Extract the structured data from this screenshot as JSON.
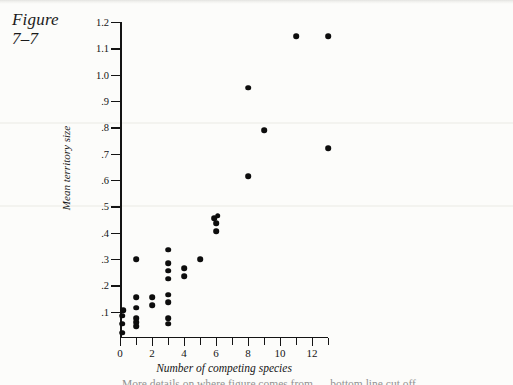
{
  "figure": {
    "label_line1": "Figure",
    "label_line2": "7–7"
  },
  "caption_partial": "More details on where figure comes from — bottom line cut off",
  "chart_data": {
    "type": "scatter",
    "title": "",
    "xlabel": "Number of competing species",
    "ylabel": "Mean territory size",
    "xlim": [
      0,
      13
    ],
    "ylim": [
      0,
      1.2
    ],
    "grid": false,
    "legend": null,
    "x_tick_labels": [
      "0",
      "2",
      "4",
      "6",
      "8",
      "10",
      "12"
    ],
    "x_tick_values": [
      0,
      2,
      4,
      6,
      8,
      10,
      12
    ],
    "x_minor_ticks": [
      1,
      3,
      5,
      7,
      9,
      11,
      13
    ],
    "y_tick_labels": [
      "1.2",
      "1.1",
      "1.0",
      ".9",
      ".8",
      ".7",
      ".6",
      ".5",
      ".4",
      ".3",
      ".2",
      ".1"
    ],
    "y_tick_values": [
      1.2,
      1.1,
      1.0,
      0.9,
      0.8,
      0.7,
      0.6,
      0.5,
      0.4,
      0.3,
      0.2,
      0.1
    ],
    "marker": "filled-circle",
    "marker_color": "#0d0d0d",
    "points": [
      {
        "x": 0.15,
        "y": 0.02
      },
      {
        "x": 0.15,
        "y": 0.055
      },
      {
        "x": 0.15,
        "y": 0.085
      },
      {
        "x": 0.2,
        "y": 0.105
      },
      {
        "x": 1.0,
        "y": 0.045
      },
      {
        "x": 1.0,
        "y": 0.06
      },
      {
        "x": 1.0,
        "y": 0.075
      },
      {
        "x": 1.0,
        "y": 0.115
      },
      {
        "x": 1.0,
        "y": 0.155
      },
      {
        "x": 1.0,
        "y": 0.3
      },
      {
        "x": 2.0,
        "y": 0.125
      },
      {
        "x": 2.0,
        "y": 0.155
      },
      {
        "x": 3.0,
        "y": 0.055
      },
      {
        "x": 3.0,
        "y": 0.075
      },
      {
        "x": 3.0,
        "y": 0.135
      },
      {
        "x": 3.0,
        "y": 0.165
      },
      {
        "x": 3.0,
        "y": 0.225
      },
      {
        "x": 3.0,
        "y": 0.255
      },
      {
        "x": 3.0,
        "y": 0.285
      },
      {
        "x": 3.0,
        "y": 0.335
      },
      {
        "x": 4.0,
        "y": 0.235
      },
      {
        "x": 4.0,
        "y": 0.265
      },
      {
        "x": 5.0,
        "y": 0.3
      },
      {
        "x": 5.9,
        "y": 0.455
      },
      {
        "x": 6.1,
        "y": 0.465
      },
      {
        "x": 6.0,
        "y": 0.435
      },
      {
        "x": 6.0,
        "y": 0.405
      },
      {
        "x": 8.0,
        "y": 0.615
      },
      {
        "x": 8.0,
        "y": 0.95
      },
      {
        "x": 9.0,
        "y": 0.79
      },
      {
        "x": 11.0,
        "y": 1.145
      },
      {
        "x": 13.0,
        "y": 1.145
      },
      {
        "x": 13.0,
        "y": 0.72
      }
    ]
  }
}
